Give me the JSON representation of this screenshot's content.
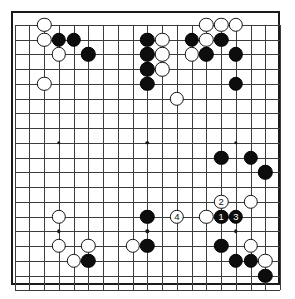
{
  "app": {
    "title": "Go game record diagram",
    "board_size": 19,
    "colors": {
      "board_background": "#ffffff",
      "grid_line": "#3c3c3c",
      "border": "#1a1a1a",
      "black_stone": "#0d0d0d",
      "white_stone": "#ffffff",
      "black_label_text": "#ffffff",
      "white_label_text": "#111111"
    }
  },
  "geometry": {
    "origin_x": 14.75,
    "origin_y": 25.0,
    "step": 14.74,
    "lines": 19,
    "board_left": 11,
    "board_top": 11,
    "board_width": 269,
    "board_height": 274
  },
  "hoshi": [
    {
      "col": 3,
      "row": 2
    },
    {
      "col": 9,
      "row": 2
    },
    {
      "col": 15,
      "row": 2
    },
    {
      "col": 3,
      "row": 8
    },
    {
      "col": 9,
      "row": 8
    },
    {
      "col": 15,
      "row": 8
    },
    {
      "col": 3,
      "row": 14
    },
    {
      "col": 9,
      "row": 14
    },
    {
      "col": 15,
      "row": 14
    }
  ],
  "stones": [
    {
      "col": 2,
      "row": 0,
      "color": "w",
      "label": ""
    },
    {
      "col": 2,
      "row": 1,
      "color": "w",
      "label": ""
    },
    {
      "col": 3,
      "row": 1,
      "color": "b",
      "label": ""
    },
    {
      "col": 4,
      "row": 1,
      "color": "b",
      "label": ""
    },
    {
      "col": 3,
      "row": 2,
      "color": "w",
      "label": ""
    },
    {
      "col": 5,
      "row": 2,
      "color": "b",
      "label": ""
    },
    {
      "col": 2,
      "row": 4,
      "color": "w",
      "label": ""
    },
    {
      "col": 9,
      "row": 1,
      "color": "b",
      "label": ""
    },
    {
      "col": 10,
      "row": 1,
      "color": "w",
      "label": ""
    },
    {
      "col": 9,
      "row": 2,
      "color": "b",
      "label": ""
    },
    {
      "col": 10,
      "row": 2,
      "color": "w",
      "label": ""
    },
    {
      "col": 9,
      "row": 3,
      "color": "b",
      "label": ""
    },
    {
      "col": 10,
      "row": 3,
      "color": "w",
      "label": ""
    },
    {
      "col": 9,
      "row": 4,
      "color": "b",
      "label": ""
    },
    {
      "col": 11,
      "row": 5,
      "color": "w",
      "label": ""
    },
    {
      "col": 13,
      "row": 0,
      "color": "w",
      "label": ""
    },
    {
      "col": 14,
      "row": 0,
      "color": "w",
      "label": ""
    },
    {
      "col": 15,
      "row": 0,
      "color": "w",
      "label": ""
    },
    {
      "col": 12,
      "row": 1,
      "color": "b",
      "label": ""
    },
    {
      "col": 13,
      "row": 1,
      "color": "w",
      "label": ""
    },
    {
      "col": 14,
      "row": 1,
      "color": "b",
      "label": ""
    },
    {
      "col": 12,
      "row": 2,
      "color": "w",
      "label": ""
    },
    {
      "col": 13,
      "row": 2,
      "color": "b",
      "label": ""
    },
    {
      "col": 15,
      "row": 2,
      "color": "b",
      "label": ""
    },
    {
      "col": 15,
      "row": 4,
      "color": "b",
      "label": ""
    },
    {
      "col": 14,
      "row": 9,
      "color": "b",
      "label": ""
    },
    {
      "col": 16,
      "row": 9,
      "color": "b",
      "label": ""
    },
    {
      "col": 17,
      "row": 10,
      "color": "b",
      "label": ""
    },
    {
      "col": 14,
      "row": 12,
      "color": "w",
      "label": "2"
    },
    {
      "col": 16,
      "row": 12,
      "color": "w",
      "label": ""
    },
    {
      "col": 11,
      "row": 13,
      "color": "w",
      "label": "4"
    },
    {
      "col": 13,
      "row": 13,
      "color": "w",
      "label": ""
    },
    {
      "col": 14,
      "row": 13,
      "color": "b",
      "label": "1"
    },
    {
      "col": 15,
      "row": 13,
      "color": "b",
      "label": "3"
    },
    {
      "col": 9,
      "row": 13,
      "color": "b",
      "label": ""
    },
    {
      "col": 3,
      "row": 13,
      "color": "w",
      "label": ""
    },
    {
      "col": 3,
      "row": 15,
      "color": "w",
      "label": ""
    },
    {
      "col": 5,
      "row": 15,
      "color": "w",
      "label": ""
    },
    {
      "col": 4,
      "row": 16,
      "color": "w",
      "label": ""
    },
    {
      "col": 5,
      "row": 16,
      "color": "b",
      "label": ""
    },
    {
      "col": 8,
      "row": 15,
      "color": "w",
      "label": ""
    },
    {
      "col": 9,
      "row": 15,
      "color": "b",
      "label": ""
    },
    {
      "col": 14,
      "row": 15,
      "color": "b",
      "label": ""
    },
    {
      "col": 16,
      "row": 15,
      "color": "w",
      "label": ""
    },
    {
      "col": 15,
      "row": 16,
      "color": "b",
      "label": ""
    },
    {
      "col": 16,
      "row": 16,
      "color": "b",
      "label": ""
    },
    {
      "col": 17,
      "row": 16,
      "color": "w",
      "label": ""
    },
    {
      "col": 17,
      "row": 17,
      "color": "b",
      "label": ""
    }
  ],
  "move_labels": [
    "1",
    "2",
    "3",
    "4"
  ]
}
